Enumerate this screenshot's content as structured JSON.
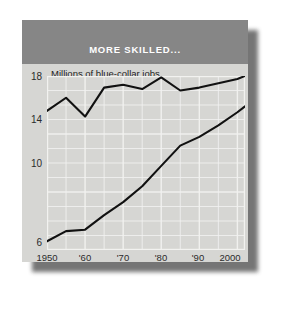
{
  "figure": {
    "title": "MORE SKILLED...",
    "units_note": "Millions of blue-collar jobs",
    "label_less": "Less-skilled workers",
    "label_more": "More-skilled workers"
  },
  "colors": {
    "page_background": "#ffffff",
    "panel_background": "#d8d8d6",
    "title_band": "#868686",
    "title_text": "#ffffff",
    "plot_background": "#d6d6d3",
    "gridline": "#f2f2f0",
    "line_series": "#111111",
    "label_less_skilled": "#f2f2f0",
    "label_more_skilled": "#1d1d1d",
    "shadow": "#5d5d5d"
  },
  "chart_data": {
    "type": "line",
    "title": "MORE SKILLED...",
    "subtitle": "Millions of blue-collar jobs",
    "xlabel": "",
    "ylabel": "Millions of blue-collar jobs",
    "xlim": [
      1950,
      2002
    ],
    "ylim": [
      6,
      18
    ],
    "grid": true,
    "legend": "inline-annotations",
    "yticks": [
      6,
      10,
      14,
      18
    ],
    "ytick_labels": [
      "6",
      "10",
      "14",
      "18"
    ],
    "xticks": [
      1950,
      1960,
      1970,
      1980,
      1990,
      2000
    ],
    "xtick_labels": [
      "1950",
      "'60",
      "'70",
      "'80",
      "'90",
      "2000"
    ],
    "x": [
      1950,
      1955,
      1960,
      1965,
      1970,
      1975,
      1980,
      1985,
      1990,
      1995,
      2000,
      2002
    ],
    "series": [
      {
        "name": "Less-skilled workers",
        "values": [
          15.6,
          16.5,
          15.2,
          17.2,
          17.4,
          17.1,
          17.9,
          17.0,
          17.2,
          17.5,
          17.8,
          18.0
        ]
      },
      {
        "name": "More-skilled workers",
        "values": [
          6.6,
          7.3,
          7.4,
          8.4,
          9.3,
          10.4,
          11.8,
          13.2,
          13.8,
          14.6,
          15.5,
          15.9
        ]
      }
    ]
  }
}
